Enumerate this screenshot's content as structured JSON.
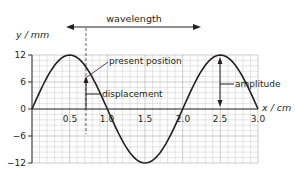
{
  "diagram": {
    "y_axis_label": "y / mm",
    "x_axis_label": "x / cm",
    "y_ticks": [
      "12",
      "6",
      "0",
      "−6",
      "−12"
    ],
    "x_ticks": [
      "0.5",
      "1.0",
      "1.5",
      "2.0",
      "2.5",
      "3.0"
    ],
    "labels": {
      "wavelength": "wavelength",
      "present_position": "present position",
      "displacement": "displacement",
      "amplitude": "amplitude"
    },
    "colors": {
      "curve": "#231f20",
      "grid": "#c8c8c8",
      "axis": "#231f20"
    }
  },
  "chart_data": {
    "type": "line",
    "title": "",
    "xlabel": "x / cm",
    "ylabel": "y / mm",
    "xlim": [
      0,
      3.0
    ],
    "ylim": [
      -12,
      12
    ],
    "x": [
      0,
      0.25,
      0.5,
      0.75,
      1.0,
      1.25,
      1.5,
      1.75,
      2.0,
      2.25,
      2.5,
      2.75,
      3.0
    ],
    "series": [
      {
        "name": "wave",
        "values": [
          0,
          8.5,
          12,
          8.5,
          0,
          -8.5,
          -12,
          -8.5,
          0,
          8.5,
          12,
          8.5,
          0
        ]
      }
    ],
    "annotations": [
      {
        "text": "wavelength",
        "type": "double-arrow",
        "from_x": 0.5,
        "to_x": 2.5
      },
      {
        "text": "present position",
        "x": 0.8,
        "y": 7.3
      },
      {
        "text": "displacement",
        "x": 0.8,
        "from_y": 0,
        "to_y": 7.3
      },
      {
        "text": "amplitude",
        "x": 2.5,
        "from_y": 0,
        "to_y": 12
      }
    ],
    "grid": true
  }
}
